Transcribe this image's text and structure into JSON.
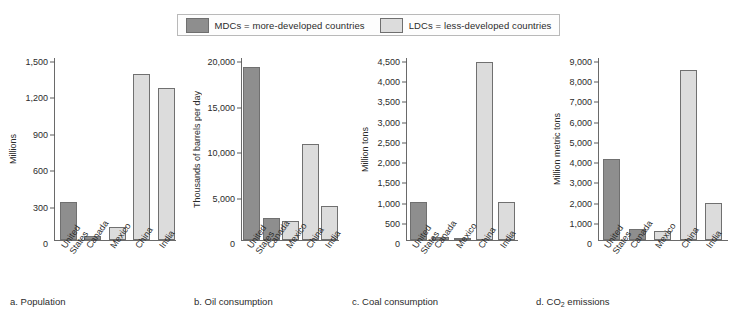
{
  "legend": {
    "entries": [
      {
        "key": "mdc",
        "label": "MDCs = more-developed countries",
        "color": "#8e8e8e"
      },
      {
        "key": "ldc",
        "label": "LDCs = less-developed countries",
        "color": "#dcdcdc"
      }
    ]
  },
  "categories": [
    "United States",
    "Canada",
    "Mexico",
    "China",
    "India"
  ],
  "category_lines": [
    [
      "United",
      "States"
    ],
    [
      "Canada"
    ],
    [
      "Mexico"
    ],
    [
      "China"
    ],
    [
      "India"
    ]
  ],
  "chart_data": [
    {
      "type": "bar",
      "title": "a. Population",
      "caption_prefix": "a.",
      "caption_text": "Population",
      "ylabel": "Millions",
      "xlabel": "",
      "categories": [
        "United States",
        "Canada",
        "Mexico",
        "China",
        "India"
      ],
      "values": [
        315,
        33,
        110,
        1370,
        1255
      ],
      "groups": [
        "MDC",
        "MDC",
        "LDC",
        "LDC",
        "LDC"
      ],
      "ylim": [
        0,
        1500
      ],
      "ticks": [
        0,
        300,
        600,
        900,
        1200,
        1500
      ],
      "tick_labels": [
        "0",
        "300",
        "600",
        "900",
        "1,200",
        "1,500"
      ],
      "grid": false,
      "legend_position": "top"
    },
    {
      "type": "bar",
      "title": "b. Oil consumption",
      "caption_prefix": "b.",
      "caption_text": "Oil consumption",
      "ylabel": "Thousands of barrels per day",
      "xlabel": "",
      "categories": [
        "United States",
        "Canada",
        "Mexico",
        "China",
        "India"
      ],
      "values": [
        19000,
        2400,
        2100,
        10600,
        3700
      ],
      "groups": [
        "MDC",
        "MDC",
        "LDC",
        "LDC",
        "LDC"
      ],
      "ylim": [
        0,
        20000
      ],
      "ticks": [
        0,
        5000,
        10000,
        15000,
        20000
      ],
      "tick_labels": [
        "0",
        "5,000",
        "10,000",
        "15,000",
        "20,000"
      ],
      "grid": false,
      "legend_position": "top"
    },
    {
      "type": "bar",
      "title": "c. Coal consumption",
      "caption_prefix": "c.",
      "caption_text": "Coal consumption",
      "ylabel": "Million tons",
      "xlabel": "",
      "categories": [
        "United States",
        "Canada",
        "Mexico",
        "China",
        "India"
      ],
      "values": [
        940,
        65,
        15,
        4400,
        940
      ],
      "groups": [
        "MDC",
        "MDC",
        "LDC",
        "LDC",
        "LDC"
      ],
      "ylim": [
        0,
        4500
      ],
      "ticks": [
        0,
        500,
        1000,
        1500,
        2000,
        2500,
        3000,
        3500,
        4000,
        4500
      ],
      "tick_labels": [
        "0",
        "500",
        "1,000",
        "1,500",
        "2,000",
        "2,500",
        "3,000",
        "3,500",
        "4,000",
        "4,500"
      ],
      "grid": false,
      "legend_position": "top"
    },
    {
      "type": "bar",
      "title": "d. CO2 emissions",
      "caption_prefix": "d.",
      "caption_text": "CO",
      "caption_sub": "2",
      "caption_suffix": " emissions",
      "ylabel": "Million metric tons",
      "xlabel": "",
      "categories": [
        "United States",
        "Canada",
        "Mexico",
        "China",
        "India"
      ],
      "values": [
        4020,
        550,
        440,
        8430,
        1850
      ],
      "groups": [
        "MDC",
        "MDC",
        "LDC",
        "LDC",
        "LDC"
      ],
      "ylim": [
        0,
        9000
      ],
      "ticks": [
        0,
        1000,
        2000,
        3000,
        4000,
        5000,
        6000,
        7000,
        8000,
        9000
      ],
      "tick_labels": [
        "0",
        "1,000",
        "2,000",
        "3,000",
        "4,000",
        "5,000",
        "6,000",
        "7,000",
        "8,000",
        "9,000"
      ],
      "grid": false,
      "legend_position": "top"
    }
  ],
  "colors": {
    "mdc": "#8e8e8e",
    "ldc": "#dcdcdc",
    "axis": "#6a6a6a",
    "text": "#2b2b2b"
  }
}
